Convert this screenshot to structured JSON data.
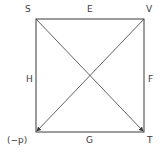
{
  "diagram": {
    "type": "square-of-opposition",
    "corners": {
      "top_left": "S",
      "top_right": "V",
      "bottom_left": "(−p)",
      "bottom_right": "T"
    },
    "edges": {
      "top": "E",
      "right": "F",
      "bottom": "G",
      "left": "H"
    },
    "diagonals": [
      {
        "from": "S",
        "to": "T",
        "arrow": "T"
      },
      {
        "from": "V",
        "to": "bottom_left",
        "arrow": "bottom_left"
      }
    ],
    "colors": {
      "line": "#3a3a3a",
      "text": "#3a3a3a"
    }
  }
}
